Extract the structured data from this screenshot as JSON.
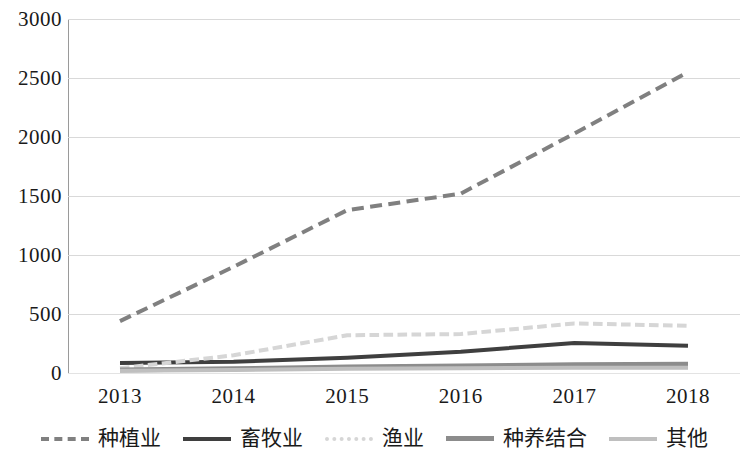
{
  "chart_data": {
    "type": "line",
    "title": "",
    "subtitle": "",
    "xlabel": "",
    "ylabel": "",
    "x": [
      "2013",
      "2014",
      "2015",
      "2016",
      "2017",
      "2018"
    ],
    "categories": [
      "2013",
      "2014",
      "2015",
      "2016",
      "2017",
      "2018"
    ],
    "ylim": [
      0,
      3000
    ],
    "yticks": [
      0,
      500,
      1000,
      1500,
      2000,
      2500,
      3000
    ],
    "ytick_labels": [
      "0",
      "500",
      "1000",
      "1500",
      "2000",
      "2500",
      "3000"
    ],
    "grid": true,
    "legend_position": "bottom",
    "series": [
      {
        "name": "种植业",
        "style": "dashed",
        "color": "#808080",
        "width": 4,
        "values": [
          440,
          900,
          1380,
          1520,
          2030,
          2550
        ]
      },
      {
        "name": "畜牧业",
        "style": "solid",
        "color": "#3f3f3f",
        "width": 4,
        "values": [
          85,
          95,
          130,
          180,
          255,
          230
        ]
      },
      {
        "name": "渔业",
        "style": "dotted",
        "color": "#d6d6d6",
        "width": 4,
        "values": [
          40,
          150,
          320,
          330,
          420,
          400
        ]
      },
      {
        "name": "种养结合",
        "style": "solid",
        "color": "#8c8c8c",
        "width": 5,
        "values": [
          25,
          35,
          50,
          60,
          70,
          75
        ]
      },
      {
        "name": "其他",
        "style": "solid",
        "color": "#bfbfbf",
        "width": 4,
        "values": [
          20,
          25,
          35,
          40,
          45,
          45
        ]
      }
    ]
  },
  "axes": {
    "y_tick_labels": [
      "3000",
      "2500",
      "2000",
      "1500",
      "1000",
      "500",
      "0"
    ],
    "x_tick_labels": [
      "2013",
      "2014",
      "2015",
      "2016",
      "2017",
      "2018"
    ]
  },
  "legend": {
    "items": [
      {
        "label": "种植业",
        "icon": "dashed-line-icon"
      },
      {
        "label": "畜牧业",
        "icon": "solid-line-icon"
      },
      {
        "label": "渔业",
        "icon": "dotted-line-icon"
      },
      {
        "label": "种养结合",
        "icon": "solid-line-icon"
      },
      {
        "label": "其他",
        "icon": "solid-line-icon"
      }
    ]
  },
  "colors": {
    "grid": "#d9d9d9",
    "axis": "#9a9a9a",
    "text": "#1a1a1a"
  }
}
